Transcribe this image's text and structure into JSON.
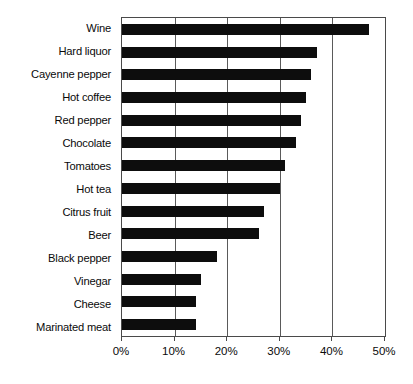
{
  "chart_data": {
    "type": "bar",
    "orientation": "horizontal",
    "title": "",
    "subtitle": "",
    "xlabel": "",
    "ylabel": "",
    "xlim": [
      0,
      50
    ],
    "grid": true,
    "legend": null,
    "categories": [
      "Wine",
      "Hard liquor",
      "Cayenne pepper",
      "Hot coffee",
      "Red pepper",
      "Chocolate",
      "Tomatoes",
      "Hot tea",
      "Citrus fruit",
      "Beer",
      "Black pepper",
      "Vinegar",
      "Cheese",
      "Marinated meat"
    ],
    "values": [
      47,
      37,
      36,
      35,
      34,
      33,
      31,
      30,
      27,
      26,
      18,
      15,
      14,
      14
    ],
    "value_unit": "%",
    "xticks": [
      0,
      10,
      20,
      30,
      40,
      50
    ],
    "xtick_labels": [
      "0%",
      "10%",
      "20%",
      "30%",
      "40%",
      "50%"
    ],
    "bar_color": "#0d0d0d",
    "grid_color": "#5a5a5a",
    "axis_color": "#4a4a4a",
    "background_color": "#ffffff"
  }
}
